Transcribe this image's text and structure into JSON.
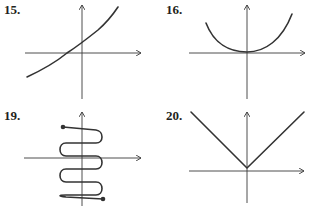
{
  "figures": [
    {
      "id": "15",
      "label": "15.",
      "description": "increasing exponential-like curve crossing x-axis left of origin"
    },
    {
      "id": "16",
      "label": "16.",
      "description": "upward parabola with vertex at origin"
    },
    {
      "id": "19",
      "label": "19.",
      "description": "horizontal zigzag curve with endpoints marked by dots"
    },
    {
      "id": "20",
      "label": "20.",
      "description": "V-shaped absolute value graph with vertex at origin"
    }
  ],
  "colors": {
    "curve": "#333333",
    "axis": "#3a3a3a",
    "label": "#231f20"
  }
}
